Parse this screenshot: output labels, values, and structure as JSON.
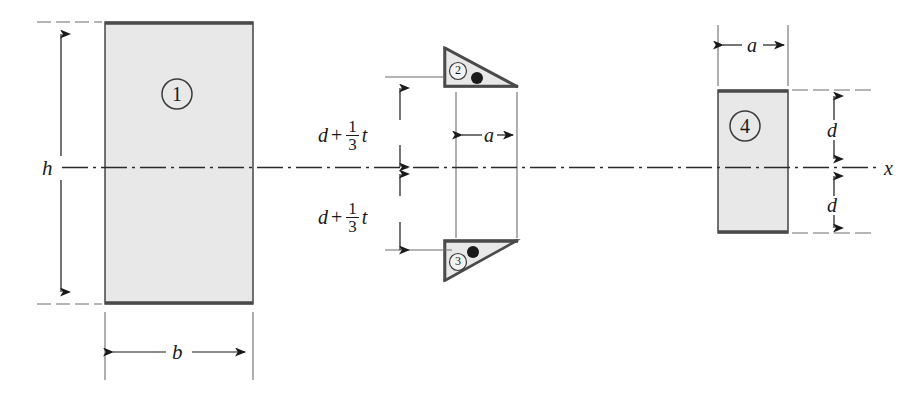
{
  "figure": {
    "type": "composite-cross-section-diagram",
    "axis_label": "x",
    "background_color": "#ffffff",
    "fill_color": "#e8e8e8",
    "stroke_color": "#3a3a3a",
    "centroid_marker_color": "#1a1a1a"
  },
  "parts": [
    {
      "id": "1",
      "shape": "rectangle",
      "label": "1",
      "width_label": "b",
      "height_label": "h"
    },
    {
      "id": "2",
      "shape": "right-triangle",
      "label": "2",
      "orientation": "hypotenuse-top-left-to-bottom-right",
      "width_label": "a",
      "offset_label": "d + 1/3 t"
    },
    {
      "id": "3",
      "shape": "right-triangle",
      "label": "3",
      "orientation": "hypotenuse-bottom-left-to-top-right",
      "width_label": "a",
      "offset_label": "d + 1/3 t"
    },
    {
      "id": "4",
      "shape": "rectangle",
      "label": "4",
      "width_label": "a",
      "half_height_label": "d"
    }
  ],
  "dimensions": {
    "h": "h",
    "b": "b",
    "a_middle": "a",
    "a_right": "a",
    "d_upper": "d",
    "d_lower": "d",
    "offset_upper": {
      "base": "d",
      "operator": "+",
      "fraction_numerator": "1",
      "fraction_denominator": "3",
      "variable": "t"
    },
    "offset_lower": {
      "base": "d",
      "operator": "+",
      "fraction_numerator": "1",
      "fraction_denominator": "3",
      "variable": "t"
    }
  },
  "axis": {
    "name": "x",
    "style": "dash-dot centerline",
    "label": "x"
  }
}
